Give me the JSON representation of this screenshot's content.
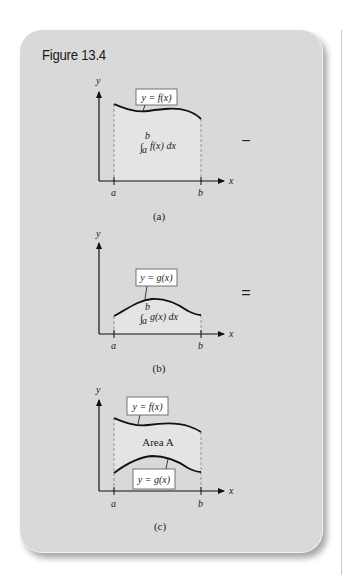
{
  "title": "Figure 13.4",
  "colors": {
    "page_background": "#ffffff",
    "panel_background": "#d9d9d9",
    "shaded_area": "#e4e4e4",
    "curve": "#111111",
    "label_box": "#ffffff"
  },
  "panels": [
    {
      "id": "a",
      "caption": "(a)",
      "curve_label": "y = f(x)",
      "area_label": "f(x) dx",
      "integral_lower": "a",
      "integral_upper": "b",
      "axis_x": "x",
      "axis_y": "y",
      "tick_a": "a",
      "tick_b": "b",
      "operator": "−"
    },
    {
      "id": "b",
      "caption": "(b)",
      "curve_label": "y = g(x)",
      "area_label": "g(x) dx",
      "integral_lower": "a",
      "integral_upper": "b",
      "axis_x": "x",
      "axis_y": "y",
      "tick_a": "a",
      "tick_b": "b",
      "operator": "="
    },
    {
      "id": "c",
      "caption": "(c)",
      "curve_label_top": "y = f(x)",
      "curve_label_bottom": "y = g(x)",
      "area_label": "Area A",
      "axis_x": "x",
      "axis_y": "y",
      "tick_a": "a",
      "tick_b": "b"
    }
  ]
}
